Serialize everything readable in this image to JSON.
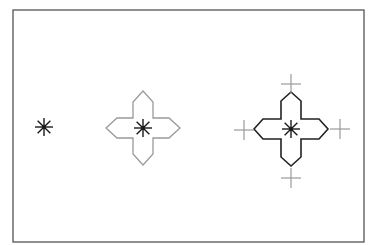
{
  "diagram": {
    "colors": {
      "frame": "#555555",
      "star": "#1a1a1a",
      "gray_outline": "#9a9a9a",
      "black_outline": "#222222",
      "plus_marker": "#9a9a9a",
      "background": "#ffffff"
    },
    "frame": {
      "x": 13,
      "y": 10,
      "width": 351,
      "height": 232
    },
    "figures": [
      {
        "id": "star-only",
        "center": [
          44,
          127
        ],
        "star_radius": 9
      },
      {
        "id": "gray-cross",
        "center": [
          143,
          128
        ],
        "star_radius": 9,
        "petal_half_width": 10,
        "petal_shoulder": 26,
        "petal_tip": 37,
        "outline": "gray"
      },
      {
        "id": "black-cross-with-markers",
        "center": [
          291,
          129
        ],
        "star_radius": 9,
        "petal_half_width": 10,
        "petal_shoulder": 28,
        "petal_tip": 37,
        "outline": "black",
        "plus_markers": [
          {
            "position": "top",
            "center": [
              291,
              84
            ],
            "half": 10
          },
          {
            "position": "left",
            "center": [
              244,
              130
            ],
            "half": 10
          },
          {
            "position": "right",
            "center": [
              340,
              129
            ],
            "half": 10
          },
          {
            "position": "bottom",
            "center": [
              291,
              178
            ],
            "half": 10
          }
        ]
      }
    ]
  }
}
